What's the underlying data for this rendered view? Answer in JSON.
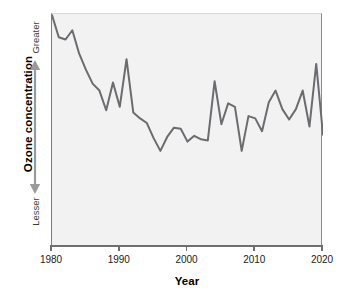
{
  "figure": {
    "background_color": "#ffffff",
    "plot_background_color": "#f2f2f2",
    "line_color": "#6b6b70",
    "axis_color": "#6f6f6f"
  },
  "axes": {
    "y": {
      "title": "Ozone concentration",
      "high_label": "Greater",
      "low_label": "Lesser",
      "arrow_icon": "double-headed-vertical-arrow-icon"
    },
    "x": {
      "title": "Year",
      "tick_labels": [
        "1980",
        "1990",
        "2000",
        "2010",
        "2020"
      ],
      "tick_values": [
        1980,
        1990,
        2000,
        2010,
        2020
      ]
    }
  },
  "chart_data": {
    "type": "line",
    "title": "",
    "subtitle": "",
    "xlabel": "Year",
    "ylabel": "Ozone concentration",
    "xlim": [
      1980,
      2020
    ],
    "ylim": [
      0,
      100
    ],
    "y_axis_qualitative": true,
    "y_low_label": "Lesser",
    "y_high_label": "Greater",
    "grid": false,
    "legend": null,
    "legend_position": "none",
    "series": [
      {
        "name": "Ozone concentration",
        "color": "#6b6b70",
        "x": [
          1980,
          1981,
          1982,
          1983,
          1984,
          1985,
          1986,
          1987,
          1988,
          1989,
          1990,
          1991,
          1992,
          1993,
          1994,
          1995,
          1996,
          1997,
          1998,
          1999,
          2000,
          2001,
          2002,
          2003,
          2004,
          2005,
          2006,
          2007,
          2008,
          2009,
          2010,
          2011,
          2012,
          2013,
          2014,
          2015,
          2016,
          2017,
          2018,
          2019,
          2020
        ],
        "values": [
          99.5,
          90.0,
          89.0,
          93.0,
          83.0,
          76.0,
          70.0,
          67.0,
          58.5,
          70.5,
          60.0,
          80.5,
          57.5,
          55.0,
          53.0,
          46.5,
          41.0,
          47.0,
          51.0,
          50.5,
          45.0,
          47.5,
          46.0,
          45.5,
          71.0,
          52.5,
          61.5,
          60.0,
          41.0,
          56.0,
          55.0,
          49.5,
          62.0,
          67.0,
          59.0,
          54.5,
          59.0,
          67.0,
          51.5,
          78.5,
          48.0
        ]
      }
    ]
  }
}
